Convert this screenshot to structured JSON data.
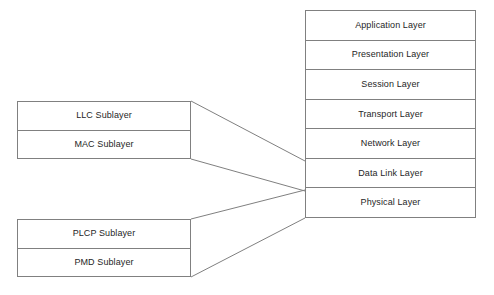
{
  "diagram": {
    "line_color": "#808080",
    "text_color": "#262626",
    "background_color": "#ffffff"
  },
  "osi_stack": {
    "name": "OSI Reference Model",
    "layers": [
      {
        "label": "Application Layer"
      },
      {
        "label": "Presentation Layer"
      },
      {
        "label": "Session Layer"
      },
      {
        "label": "Transport Layer"
      },
      {
        "label": "Network Layer"
      },
      {
        "label": "Data Link Layer"
      },
      {
        "label": "Physical Layer"
      }
    ]
  },
  "datalink_group": {
    "name": "Data Link sublayers",
    "sublayers": [
      {
        "label": "LLC Sublayer"
      },
      {
        "label": "MAC Sublayer"
      }
    ]
  },
  "physical_group": {
    "name": "Physical sublayers",
    "sublayers": [
      {
        "label": "PLCP Sublayer"
      },
      {
        "label": "PMD Sublayer"
      }
    ]
  },
  "connectors": [
    {
      "name": "llc-mac-to-data-link-upper",
      "from_x": 191,
      "from_y": 101,
      "to_x": 305,
      "to_y": 161
    },
    {
      "name": "llc-mac-to-data-link-lower",
      "from_x": 191,
      "from_y": 159,
      "to_x": 305,
      "to_y": 191
    },
    {
      "name": "plcp-pmd-to-physical-upper",
      "from_x": 191,
      "from_y": 219,
      "to_x": 305,
      "to_y": 190
    },
    {
      "name": "plcp-pmd-to-physical-lower",
      "from_x": 191,
      "from_y": 277,
      "to_x": 305,
      "to_y": 218
    }
  ]
}
